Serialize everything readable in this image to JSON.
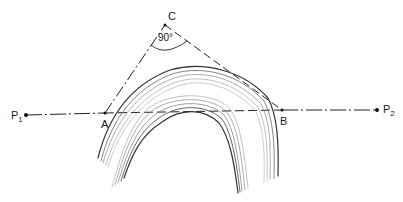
{
  "figure": {
    "points": {
      "C": {
        "label": "C",
        "x": 165,
        "y": 25
      },
      "A": {
        "label": "A",
        "x": 105,
        "y": 113
      },
      "B": {
        "label": "B",
        "x": 282,
        "y": 110
      },
      "P1": {
        "label": "P",
        "subscript": "1",
        "x": 26,
        "y": 115
      },
      "P2": {
        "label": "P",
        "subscript": "2",
        "x": 377,
        "y": 110
      }
    },
    "angle_label": "90°",
    "line_color": "#222222",
    "fold_color_dark": "#333333",
    "fold_color_light": "#8a8a8a"
  }
}
